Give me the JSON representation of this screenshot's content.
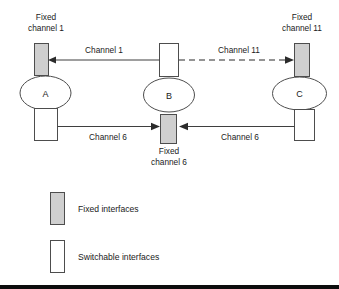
{
  "diagram": {
    "type": "network-topology",
    "colors": {
      "fixed_fill": "#cfcfcf",
      "switchable_fill": "#ffffff",
      "stroke": "#4d4d4d",
      "link": "#3f3f3f",
      "text": "#1a1a1a",
      "background": "#ffffff"
    },
    "nodes": [
      {
        "id": "A",
        "label": "A"
      },
      {
        "id": "B",
        "label": "B"
      },
      {
        "id": "C",
        "label": "C"
      }
    ],
    "interface_labels": [
      {
        "id": "fixed-channel-1",
        "line1": "Fixed",
        "line2": "channel 1"
      },
      {
        "id": "fixed-channel-11",
        "line1": "Fixed",
        "line2": "channel 11"
      },
      {
        "id": "fixed-channel-6",
        "line1": "Fixed",
        "line2": "channel 6"
      }
    ],
    "links": [
      {
        "id": "channel-1",
        "label": "Channel 1",
        "style": "solid",
        "from": "B",
        "to": "A"
      },
      {
        "id": "channel-11",
        "label": "Channel 11",
        "style": "dashed",
        "from": "B",
        "to": "C"
      },
      {
        "id": "channel-6-left",
        "label": "Channel 6",
        "style": "solid",
        "from": "A",
        "to": "B"
      },
      {
        "id": "channel-6-right",
        "label": "Channel 6",
        "style": "solid",
        "from": "C",
        "to": "B"
      }
    ],
    "legend": [
      {
        "id": "fixed-interfaces",
        "label": "Fixed interfaces",
        "swatch": "fixed"
      },
      {
        "id": "switchable-interfaces",
        "label": "Switchable interfaces",
        "swatch": "switchable"
      }
    ]
  }
}
